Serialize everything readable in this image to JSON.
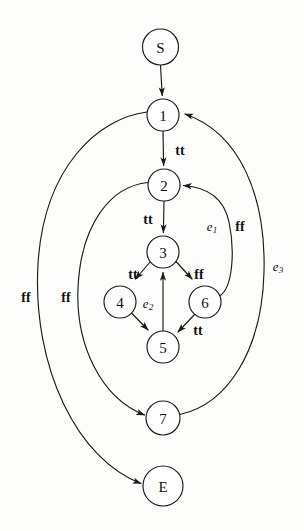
{
  "diagram": {
    "type": "control-flow-graph",
    "title": "",
    "nodes": [
      {
        "id": "S",
        "label": "S",
        "cx": 160,
        "cy": 47,
        "r": 18
      },
      {
        "id": "1",
        "label": "1",
        "cx": 163,
        "cy": 115,
        "r": 16
      },
      {
        "id": "2",
        "label": "2",
        "cx": 164,
        "cy": 185,
        "r": 16
      },
      {
        "id": "3",
        "label": "3",
        "cx": 163,
        "cy": 252,
        "r": 16
      },
      {
        "id": "4",
        "label": "4",
        "cx": 120,
        "cy": 302,
        "r": 16
      },
      {
        "id": "6",
        "label": "6",
        "cx": 205,
        "cy": 302,
        "r": 16
      },
      {
        "id": "5",
        "label": "5",
        "cx": 163,
        "cy": 347,
        "r": 16
      },
      {
        "id": "7",
        "label": "7",
        "cx": 163,
        "cy": 418,
        "r": 17
      },
      {
        "id": "E",
        "label": "E",
        "cx": 163,
        "cy": 486,
        "r": 20
      }
    ],
    "edges": [
      {
        "from": "S",
        "to": "1",
        "label": ""
      },
      {
        "from": "1",
        "to": "2",
        "label": "tt"
      },
      {
        "from": "1",
        "to": "E",
        "label": "ff"
      },
      {
        "from": "2",
        "to": "3",
        "label": "tt"
      },
      {
        "from": "2",
        "to": "7",
        "label": "ff"
      },
      {
        "from": "3",
        "to": "4",
        "label": "tt"
      },
      {
        "from": "3",
        "to": "6",
        "label": "ff"
      },
      {
        "from": "4",
        "to": "5",
        "label": ""
      },
      {
        "from": "6",
        "to": "5",
        "label": "tt"
      },
      {
        "from": "5",
        "to": "3",
        "label": "e2"
      },
      {
        "from": "6",
        "to": "2",
        "label": "ff"
      },
      {
        "from": "7",
        "to": "1",
        "label": "e3"
      }
    ],
    "labels": {
      "tt_1_2": "tt",
      "tt_2_3": "tt",
      "tt_3_4": "tt",
      "ff_3_6": "ff",
      "tt_6_5": "tt",
      "ff_1_E": "ff",
      "ff_2_7": "ff",
      "ff_6_2": "ff",
      "e1": "e",
      "e1_sub": "1",
      "e2": "e",
      "e2_sub": "2",
      "e3": "e",
      "e3_sub": "3"
    },
    "colors": {
      "stroke": "#1a1a1a",
      "node_fill": "#ffffff",
      "background": "#fdfdfc",
      "text": "#101010"
    }
  }
}
